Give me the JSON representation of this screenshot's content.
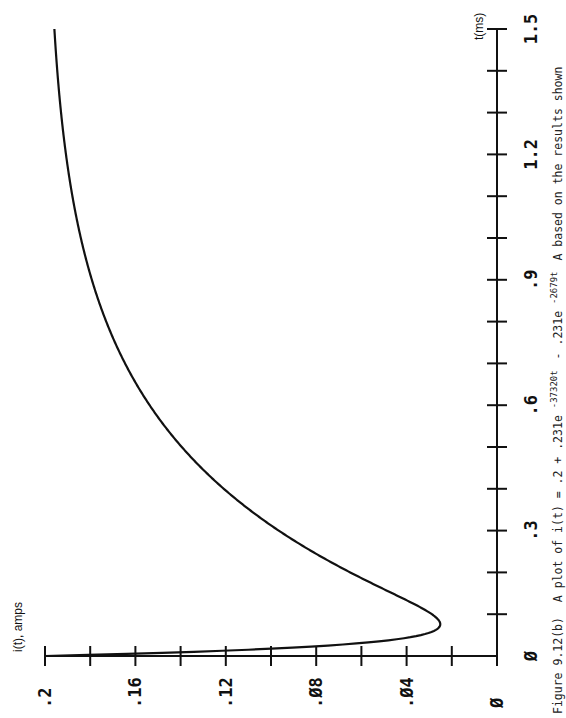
{
  "chart_data": {
    "type": "line",
    "orientation": "rotated-90-ccw",
    "title": "",
    "caption": "Figure 9.12(b)  A plot of i(t) = .2 + .231e-37320t - .231e-2679tA based on the results shown",
    "caption_parts": {
      "figure": "Figure 9.12(b)",
      "text": "A plot of i(t) = .2 + .231e",
      "exp1": "-37320t",
      "mid": "- .231e",
      "exp2": "-2679t",
      "tail": "A based on the results shown"
    },
    "xlabel": "t(ms)",
    "ylabel": "i(t), amps",
    "xlim": [
      0,
      1.5
    ],
    "ylim": [
      0,
      0.2
    ],
    "x_ticks": [
      0,
      0.1,
      0.2,
      0.3,
      0.4,
      0.5,
      0.6,
      0.7,
      0.8,
      0.9,
      1.0,
      1.1,
      1.2,
      1.3,
      1.4,
      1.5
    ],
    "x_tick_labels": [
      {
        "value": 0,
        "label": "Ø"
      },
      {
        "value": 0.3,
        "label": ".3"
      },
      {
        "value": 0.6,
        "label": ".6"
      },
      {
        "value": 0.9,
        "label": ".9"
      },
      {
        "value": 1.2,
        "label": "1.2"
      },
      {
        "value": 1.5,
        "label": "1.5"
      }
    ],
    "y_ticks": [
      0,
      0.02,
      0.04,
      0.06,
      0.08,
      0.1,
      0.12,
      0.14,
      0.16,
      0.18,
      0.2
    ],
    "y_tick_labels": [
      {
        "value": 0.2,
        "label": ".2"
      },
      {
        "value": 0.16,
        "label": ".16"
      },
      {
        "value": 0.12,
        "label": ".12"
      },
      {
        "value": 0.08,
        "label": ".Ø8"
      },
      {
        "value": 0.04,
        "label": ".Ø4"
      },
      {
        "value": 0,
        "label": "Ø"
      }
    ],
    "grid": false,
    "legend": null,
    "series": [
      {
        "name": "i(t)",
        "equation": {
          "constant": 0.2,
          "a1": 0.231,
          "k1": 37320,
          "a2": -0.231,
          "k2": 2679
        },
        "x": [
          0,
          0.01,
          0.02,
          0.03,
          0.04,
          0.05,
          0.06,
          0.07,
          0.08,
          0.09,
          0.1,
          0.12,
          0.15,
          0.2,
          0.25,
          0.3,
          0.4,
          0.5,
          0.6,
          0.7,
          0.8,
          0.9,
          1.0,
          1.1,
          1.2,
          1.3,
          1.4,
          1.5
        ],
        "y": [
          0.2,
          0.1271,
          0.086,
          0.0627,
          0.0493,
          0.0412,
          0.0362,
          0.033,
          0.0309,
          0.0293,
          0.0283,
          0.0283,
          0.032,
          0.0464,
          0.0632,
          0.0903,
          0.1205,
          0.14,
          0.1545,
          0.1647,
          0.1726,
          0.1792,
          0.1848,
          0.1888,
          0.192,
          0.1937,
          0.195,
          0.1958
        ],
        "minimum": {
          "t": 0.09,
          "i": 0.025
        }
      }
    ]
  }
}
